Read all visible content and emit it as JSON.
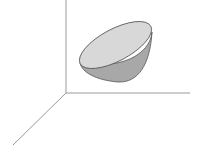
{
  "diagram": {
    "type": "3d-solid",
    "axes": {
      "origin": [
        66,
        93
      ],
      "z_axis_end": [
        66,
        0
      ],
      "x_axis_end": [
        190,
        93
      ],
      "y_axis_end": [
        13,
        145
      ],
      "color": "#9a9a9a"
    },
    "solid": {
      "rim_fill": "#d8d8d8",
      "body_fill": "#a8a8a8",
      "outline": "#555555"
    }
  }
}
